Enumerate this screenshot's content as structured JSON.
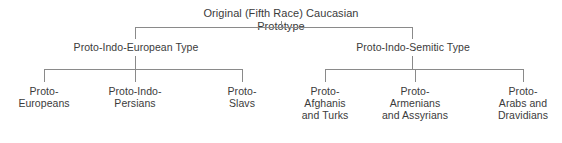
{
  "diagram": {
    "type": "hierarchy-tree",
    "title": "Original (Fifth Race) Caucasian Prototype",
    "background_color": "#ffffff",
    "text_color": "#3b3b3b",
    "line_color": "#8a8a8a",
    "root": {
      "label": "Original (Fifth Race) Caucasian Prototype"
    },
    "branches": [
      {
        "label": "Proto-Indo-European Type",
        "children": [
          {
            "label": "Proto-\nEuropeans"
          },
          {
            "label": "Proto-Indo-\nPersians"
          },
          {
            "label": "Proto-\nSlavs"
          }
        ]
      },
      {
        "label": "Proto-Indo-Semitic Type",
        "children": [
          {
            "label": "Proto-\nAfghanis\nand Turks"
          },
          {
            "label": "Proto-\nArmenians\nand Assyrians"
          },
          {
            "label": "Proto-\nArabs and\nDravidians"
          }
        ]
      }
    ]
  }
}
